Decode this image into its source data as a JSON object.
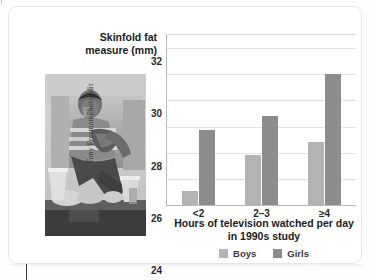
{
  "figure": {
    "photo_credit": "Tony Freeman/PhotoEdit",
    "photo_alt": "Teen sitting on couch eating snacks and drinking soda",
    "card_background": "#ffffff"
  },
  "chart_data": {
    "type": "bar",
    "title": "",
    "subtitle": "",
    "ylabel": "Skinfold fat measure (mm)",
    "xlabel": "Hours of television watched per day in 1990s study",
    "xlabel_line1": "Hours of television watched per day",
    "xlabel_line2": "in 1990s study",
    "categories": [
      "<2",
      "2–3",
      "≥4"
    ],
    "series": [
      {
        "name": "Boys",
        "color": "#b3b3b3",
        "values": [
          21.1,
          23.8,
          24.8
        ]
      },
      {
        "name": "Girls",
        "color": "#8c8c8c",
        "values": [
          25.7,
          26.8,
          30.0
        ]
      }
    ],
    "ylim": [
      20,
      33
    ],
    "yticks": [
      20,
      22,
      24,
      26,
      28,
      30,
      32
    ],
    "ytick_labels": [
      "20",
      "22",
      "24",
      "26",
      "28",
      "30",
      "32"
    ],
    "grid": true,
    "grid_axis": "y",
    "grid_color": "#e2e2e2",
    "legend": {
      "position": "bottom",
      "entries": [
        {
          "label": "Boys",
          "color": "#b3b3b3"
        },
        {
          "label": "Girls",
          "color": "#8c8c8c"
        }
      ]
    }
  }
}
